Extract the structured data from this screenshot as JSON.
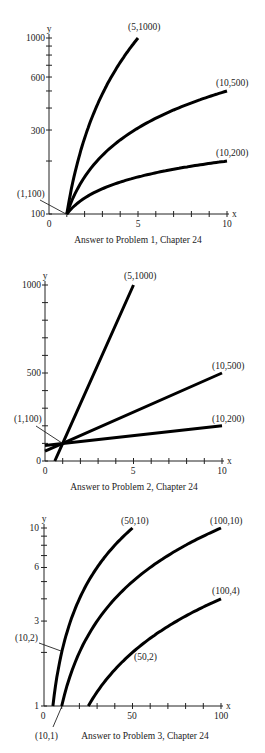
{
  "chart_data": [
    {
      "type": "line",
      "title": "Answer to Problem 1, Chapter 24",
      "xlabel": "x",
      "ylabel": "y",
      "xscale": "linear",
      "yscale": "log",
      "xlim": [
        0,
        10
      ],
      "ylim": [
        100,
        1000
      ],
      "x_tick_labels": [
        "0",
        "5",
        "10"
      ],
      "x_ticks": [
        0,
        1,
        2,
        3,
        4,
        5,
        6,
        7,
        8,
        9,
        10
      ],
      "y_tick_labels": [
        "100",
        "300",
        "600",
        "1000"
      ],
      "y_ticks": [
        100,
        200,
        300,
        400,
        500,
        600,
        700,
        800,
        900,
        1000
      ],
      "series": [
        {
          "name": "curve through (5,1000)",
          "points": [
            [
              1,
              100
            ],
            [
              5,
              1000
            ]
          ],
          "end_label": "(5,1000)"
        },
        {
          "name": "curve through (10,500)",
          "points": [
            [
              1,
              100
            ],
            [
              10,
              500
            ]
          ],
          "end_label": "(10,500)"
        },
        {
          "name": "curve through (10,200)",
          "points": [
            [
              1,
              100
            ],
            [
              10,
              200
            ]
          ],
          "end_label": "(10,200)"
        }
      ],
      "annotations": [
        "(1,100)",
        "(5,1000)",
        "(10,500)",
        "(10,200)"
      ]
    },
    {
      "type": "line",
      "title": "Answer to Problem 2, Chapter 24",
      "xlabel": "x",
      "ylabel": "y",
      "xscale": "linear",
      "yscale": "linear",
      "xlim": [
        0,
        10
      ],
      "ylim": [
        0,
        1000
      ],
      "x_tick_labels": [
        "0",
        "5",
        "10"
      ],
      "x_ticks": [
        0,
        1,
        2,
        3,
        4,
        5,
        6,
        7,
        8,
        9,
        10
      ],
      "y_tick_labels": [
        "0",
        "500",
        "1000"
      ],
      "y_ticks": [
        0,
        100,
        200,
        300,
        400,
        500,
        600,
        700,
        800,
        900,
        1000
      ],
      "series": [
        {
          "name": "line through (5,1000)",
          "points": [
            [
              0.556,
              0
            ],
            [
              1,
              100
            ],
            [
              5,
              1000
            ]
          ],
          "end_label": "(5,1000)"
        },
        {
          "name": "line through (10,500)",
          "points": [
            [
              0,
              55.6
            ],
            [
              1,
              100
            ],
            [
              10,
              500
            ]
          ],
          "end_label": "(10,500)"
        },
        {
          "name": "line through (10,200)",
          "points": [
            [
              0,
              88.9
            ],
            [
              1,
              100
            ],
            [
              10,
              200
            ]
          ],
          "end_label": "(10,200)"
        }
      ],
      "annotations": [
        "(1,100)",
        "(5,1000)",
        "(10,500)",
        "(10,200)"
      ]
    },
    {
      "type": "line",
      "title": "Answer to Problem 3, Chapter 24",
      "xlabel": "x",
      "ylabel": "y",
      "xscale": "linear",
      "yscale": "log",
      "xlim": [
        0,
        100
      ],
      "ylim": [
        1,
        10
      ],
      "x_tick_labels": [
        "0",
        "50",
        "100"
      ],
      "x_ticks": [
        0,
        10,
        20,
        30,
        40,
        50,
        60,
        70,
        80,
        90,
        100
      ],
      "y_tick_labels": [
        "1",
        "3",
        "6",
        "10"
      ],
      "y_ticks": [
        1,
        2,
        3,
        4,
        5,
        6,
        7,
        8,
        9,
        10
      ],
      "series": [
        {
          "name": "y = x/5",
          "points": [
            [
              5,
              1
            ],
            [
              10,
              2
            ],
            [
              50,
              10
            ]
          ],
          "end_label": "(50,10)"
        },
        {
          "name": "y = x/10",
          "points": [
            [
              10,
              1
            ],
            [
              100,
              10
            ]
          ],
          "end_label": "(100,10)"
        },
        {
          "name": "y = x/25",
          "points": [
            [
              25,
              1
            ],
            [
              50,
              2
            ],
            [
              100,
              4
            ]
          ],
          "end_label": "(100,4)"
        }
      ],
      "annotations": [
        "(10,2)",
        "(10,1)",
        "(50,10)",
        "(100,10)",
        "(100,4)",
        "(50,2)"
      ]
    }
  ],
  "charts": [
    {
      "caption": "Answer to Problem 1, Chapter 24",
      "axis_x": "x",
      "axis_y": "y",
      "xt": [
        "0",
        "5",
        "10"
      ],
      "yt": [
        "1000",
        "600",
        "300",
        "100"
      ],
      "labels": [
        "(5,1000)",
        "(10,500)",
        "(10,200)",
        "(1,100)"
      ]
    },
    {
      "caption": "Answer to Problem 2, Chapter 24",
      "axis_x": "x",
      "axis_y": "y",
      "xt": [
        "0",
        "5",
        "10"
      ],
      "yt": [
        "1000",
        "500",
        "0"
      ],
      "labels": [
        "(5,1000)",
        "(10,500)",
        "(10,200)",
        "(1,100)"
      ]
    },
    {
      "caption": "Answer to Problem 3, Chapter 24",
      "axis_x": "x",
      "axis_y": "y",
      "xt": [
        "0",
        "50",
        "100"
      ],
      "yt": [
        "10",
        "6",
        "3",
        "1"
      ],
      "labels": [
        "(50,10)",
        "(100,10)",
        "(100,4)",
        "(10,2)",
        "(50,2)",
        "(10,1)"
      ]
    }
  ]
}
